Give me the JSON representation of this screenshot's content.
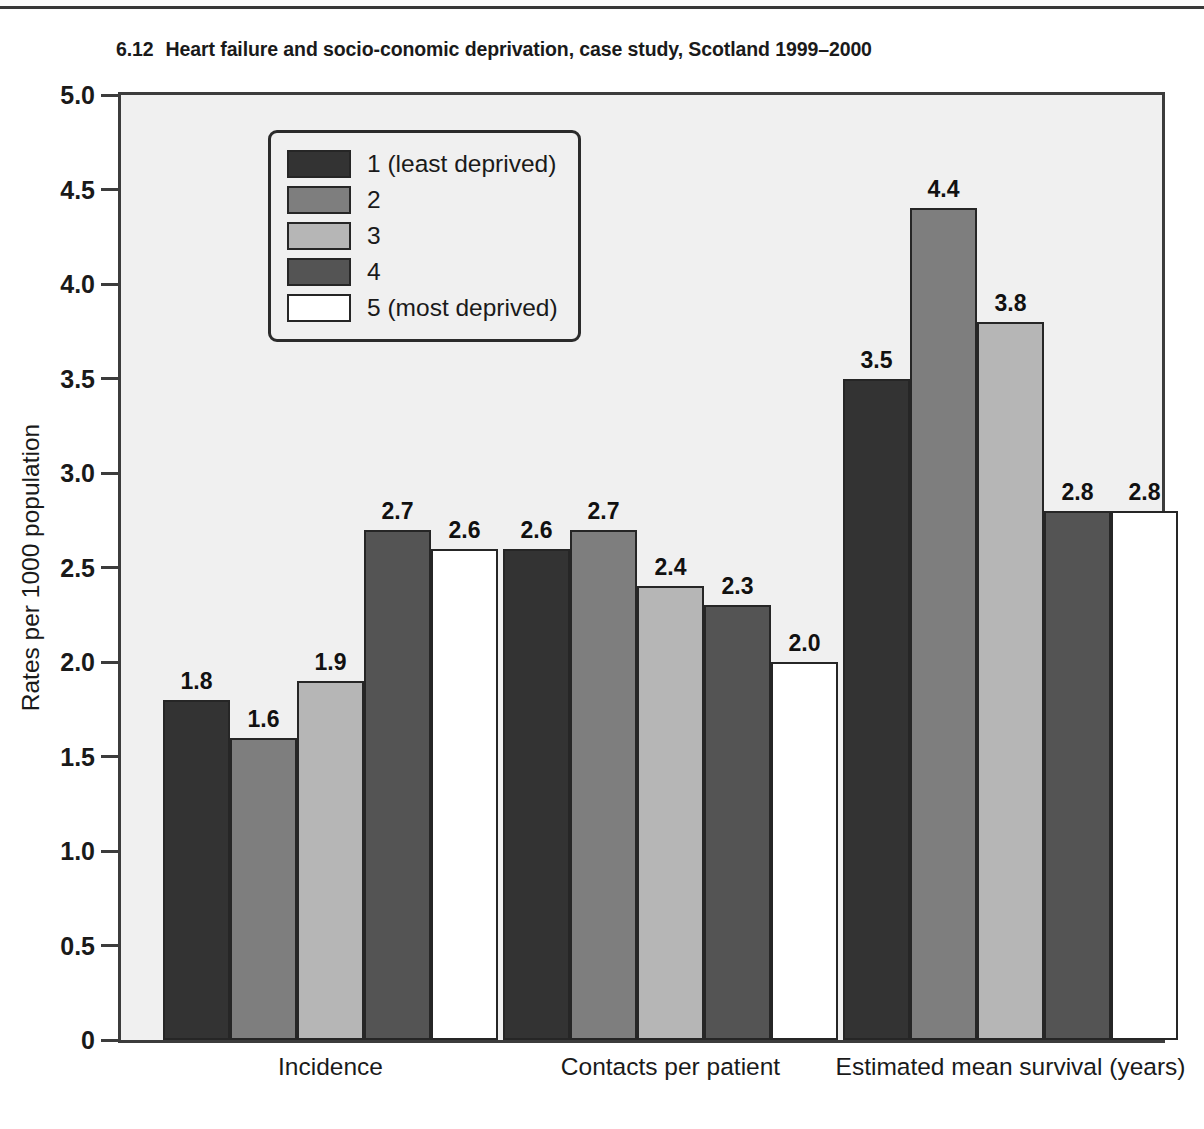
{
  "page": {
    "title_number": "6.12",
    "title_text": "Heart failure and socio-conomic deprivation, case study, Scotland 1999–2000"
  },
  "chart_data": {
    "type": "bar",
    "xlabel": "",
    "ylabel": "Rates per 1000 population",
    "ylim": [
      0,
      5.0
    ],
    "yticks": [
      0,
      0.5,
      1.0,
      1.5,
      2.0,
      2.5,
      3.0,
      3.5,
      4.0,
      4.5,
      5.0
    ],
    "ytick_labels": [
      "0",
      "0.5",
      "1.0",
      "1.5",
      "2.0",
      "2.5",
      "3.0",
      "3.5",
      "4.0",
      "4.5",
      "5.0"
    ],
    "grid": false,
    "legend_position": "upper-left-inside",
    "categories": [
      "Incidence",
      "Contacts per patient",
      "Estimated mean survival (years)"
    ],
    "series": [
      {
        "name": "1 (least deprived)",
        "color": "#333333",
        "values": [
          1.8,
          2.6,
          3.5
        ],
        "labels": [
          "1.8",
          "2.6",
          "3.5"
        ]
      },
      {
        "name": "2",
        "color": "#7e7e7e",
        "values": [
          1.6,
          2.7,
          4.4
        ],
        "labels": [
          "1.6",
          "2.7",
          "4.4"
        ]
      },
      {
        "name": "3",
        "color": "#b6b6b6",
        "values": [
          1.9,
          2.4,
          3.8
        ],
        "labels": [
          "1.9",
          "2.4",
          "3.8"
        ]
      },
      {
        "name": "4",
        "color": "#545454",
        "values": [
          2.7,
          2.3,
          2.8
        ],
        "labels": [
          "2.7",
          "2.3",
          "2.8"
        ]
      },
      {
        "name": "5 (most deprived)",
        "color": "#ffffff",
        "values": [
          2.6,
          2.0,
          2.8
        ],
        "labels": [
          "2.6",
          "2.0",
          "2.8"
        ]
      }
    ]
  },
  "legend": {
    "items": [
      {
        "label": "1 (least deprived)",
        "color": "#333333"
      },
      {
        "label": "2",
        "color": "#7e7e7e"
      },
      {
        "label": "3",
        "color": "#b6b6b6"
      },
      {
        "label": "4",
        "color": "#545454"
      },
      {
        "label": "5 (most deprived)",
        "color": "#ffffff"
      }
    ]
  },
  "layout": {
    "plot_bg": "#f0f0f0",
    "axis_color": "#3c3c3c",
    "bar_outline": "#262626",
    "group_starts_px": [
      42,
      382,
      722
    ],
    "bar_width_px": 67,
    "group_width_px": 335
  }
}
